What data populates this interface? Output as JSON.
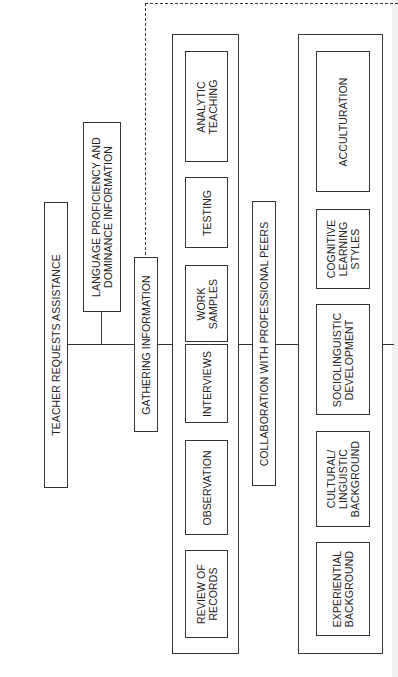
{
  "diagram": {
    "root": {
      "label": "TEACHER REQUESTS ASSISTANCE"
    },
    "language_info": {
      "label": "LANGUAGE PROFICIENCY AND\nDOMINANCE INFORMATION"
    },
    "gathering": {
      "label": "GATHERING INFORMATION",
      "methods": [
        {
          "label": "ANALYTIC\nTEACHING"
        },
        {
          "label": "TESTING"
        },
        {
          "label": "WORK\nSAMPLES"
        },
        {
          "label": "INTERVIEWS"
        },
        {
          "label": "OBSERVATION"
        },
        {
          "label": "REVIEW OF\nRECORDS"
        }
      ]
    },
    "collaboration": {
      "label": "COLLABORATION WITH PROFESSIONAL PEERS"
    },
    "factors": [
      {
        "label": "ACCULTURATION"
      },
      {
        "label": "COGNITIVE\nLEARNING\nSTYLES"
      },
      {
        "label": "SOCIOLINGUISTIC\nDEVELOPMENT"
      },
      {
        "label": "CULTURAL/\nLINGUISTIC\nBACKGROUND"
      },
      {
        "label": "EXPERIENTIAL\nBACKGROUND"
      }
    ],
    "colors": {
      "line": "#333333",
      "background": "#ffffff"
    }
  }
}
